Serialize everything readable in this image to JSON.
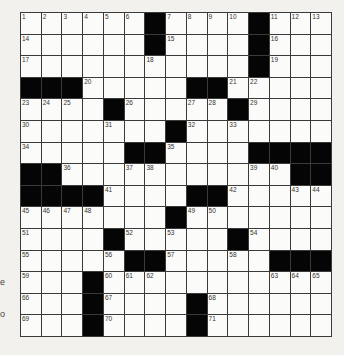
{
  "puzzle": {
    "size": {
      "rows": 15,
      "cols": 15
    },
    "grid": [
      "......#....#...",
      "......#....#...",
      "...........#...",
      "###.....##.....",
      "....#.....#....",
      ".......#.......",
      ".....##....####",
      "##...........##",
      "####....##.....",
      ".......#.......",
      "....#.....#....",
      ".....##.....###",
      "...#...........",
      "...#....#......",
      "...#....#......"
    ],
    "numbers": [
      {
        "r": 0,
        "c": 0,
        "n": 1
      },
      {
        "r": 0,
        "c": 1,
        "n": 2
      },
      {
        "r": 0,
        "c": 2,
        "n": 3
      },
      {
        "r": 0,
        "c": 3,
        "n": 4
      },
      {
        "r": 0,
        "c": 4,
        "n": 5
      },
      {
        "r": 0,
        "c": 5,
        "n": 6
      },
      {
        "r": 0,
        "c": 7,
        "n": 7
      },
      {
        "r": 0,
        "c": 8,
        "n": 8
      },
      {
        "r": 0,
        "c": 9,
        "n": 9
      },
      {
        "r": 0,
        "c": 10,
        "n": 10
      },
      {
        "r": 0,
        "c": 12,
        "n": 11
      },
      {
        "r": 0,
        "c": 13,
        "n": 12
      },
      {
        "r": 0,
        "c": 14,
        "n": 13
      },
      {
        "r": 1,
        "c": 0,
        "n": 14
      },
      {
        "r": 1,
        "c": 7,
        "n": 15
      },
      {
        "r": 1,
        "c": 12,
        "n": 16
      },
      {
        "r": 2,
        "c": 0,
        "n": 17
      },
      {
        "r": 2,
        "c": 6,
        "n": 18
      },
      {
        "r": 2,
        "c": 12,
        "n": 19
      },
      {
        "r": 3,
        "c": 3,
        "n": 20
      },
      {
        "r": 3,
        "c": 10,
        "n": 21
      },
      {
        "r": 3,
        "c": 11,
        "n": 22
      },
      {
        "r": 4,
        "c": 0,
        "n": 23
      },
      {
        "r": 4,
        "c": 1,
        "n": 24
      },
      {
        "r": 4,
        "c": 2,
        "n": 25
      },
      {
        "r": 4,
        "c": 5,
        "n": 26
      },
      {
        "r": 4,
        "c": 8,
        "n": 27
      },
      {
        "r": 4,
        "c": 9,
        "n": 28
      },
      {
        "r": 4,
        "c": 11,
        "n": 29
      },
      {
        "r": 5,
        "c": 0,
        "n": 30
      },
      {
        "r": 5,
        "c": 4,
        "n": 31
      },
      {
        "r": 5,
        "c": 8,
        "n": 32
      },
      {
        "r": 5,
        "c": 10,
        "n": 33
      },
      {
        "r": 6,
        "c": 0,
        "n": 34
      },
      {
        "r": 6,
        "c": 7,
        "n": 35
      },
      {
        "r": 7,
        "c": 2,
        "n": 36
      },
      {
        "r": 7,
        "c": 5,
        "n": 37
      },
      {
        "r": 7,
        "c": 6,
        "n": 38
      },
      {
        "r": 7,
        "c": 11,
        "n": 39
      },
      {
        "r": 7,
        "c": 12,
        "n": 40
      },
      {
        "r": 8,
        "c": 4,
        "n": 41
      },
      {
        "r": 8,
        "c": 10,
        "n": 42
      },
      {
        "r": 8,
        "c": 13,
        "n": 43
      },
      {
        "r": 8,
        "c": 14,
        "n": 44
      },
      {
        "r": 9,
        "c": 0,
        "n": 45
      },
      {
        "r": 9,
        "c": 1,
        "n": 46
      },
      {
        "r": 9,
        "c": 2,
        "n": 47
      },
      {
        "r": 9,
        "c": 3,
        "n": 48
      },
      {
        "r": 9,
        "c": 8,
        "n": 49
      },
      {
        "r": 9,
        "c": 9,
        "n": 50
      },
      {
        "r": 10,
        "c": 0,
        "n": 51
      },
      {
        "r": 10,
        "c": 5,
        "n": 52
      },
      {
        "r": 10,
        "c": 7,
        "n": 53
      },
      {
        "r": 10,
        "c": 11,
        "n": 54
      },
      {
        "r": 11,
        "c": 0,
        "n": 55
      },
      {
        "r": 11,
        "c": 4,
        "n": 56
      },
      {
        "r": 11,
        "c": 7,
        "n": 57
      },
      {
        "r": 11,
        "c": 10,
        "n": 58
      },
      {
        "r": 12,
        "c": 0,
        "n": 59
      },
      {
        "r": 12,
        "c": 4,
        "n": 60
      },
      {
        "r": 12,
        "c": 5,
        "n": 61
      },
      {
        "r": 12,
        "c": 6,
        "n": 62
      },
      {
        "r": 12,
        "c": 12,
        "n": 63
      },
      {
        "r": 12,
        "c": 13,
        "n": 64
      },
      {
        "r": 12,
        "c": 14,
        "n": 65
      },
      {
        "r": 13,
        "c": 0,
        "n": 66
      },
      {
        "r": 13,
        "c": 4,
        "n": 67
      },
      {
        "r": 13,
        "c": 9,
        "n": 68
      },
      {
        "r": 14,
        "c": 0,
        "n": 69
      },
      {
        "r": 14,
        "c": 4,
        "n": 70
      },
      {
        "r": 14,
        "c": 9,
        "n": 71
      }
    ]
  },
  "margin_fragments": [
    {
      "text": "e",
      "top": 277
    },
    {
      "text": "o",
      "top": 309
    }
  ],
  "colors": {
    "background": "#f2f1ee",
    "cell": "#fbfbf9",
    "block": "#050505",
    "grid_line": "#3a3a3a"
  }
}
